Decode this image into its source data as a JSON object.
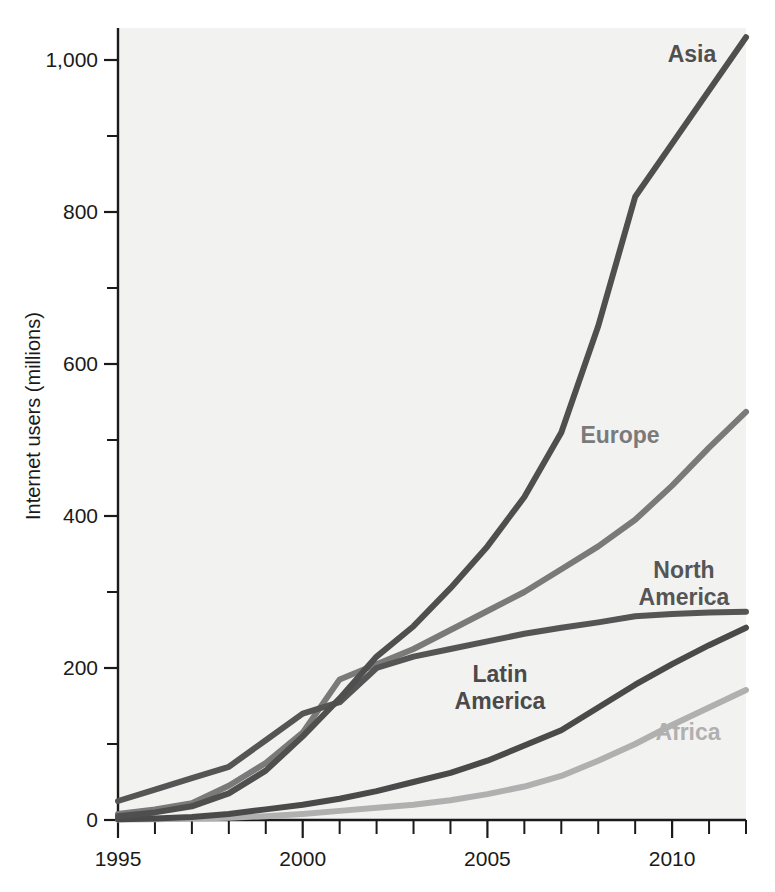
{
  "chart_data": {
    "type": "line",
    "title": "",
    "subtitle": "",
    "xlabel": "",
    "ylabel": "Internet users (millions)",
    "xlim": [
      1995,
      2012
    ],
    "ylim": [
      0,
      1080
    ],
    "grid": false,
    "legend_position": "inline-labels",
    "x_tick_labels": [
      "1995",
      "2000",
      "2005",
      "2010"
    ],
    "x_tick_values": [
      1995,
      2000,
      2005,
      2010
    ],
    "x_minor_ticks": [
      1996,
      1997,
      1998,
      1999,
      2001,
      2002,
      2003,
      2004,
      2006,
      2007,
      2008,
      2009,
      2011,
      2012
    ],
    "y_tick_labels": [
      "0",
      "200",
      "400",
      "600",
      "800",
      "1,000"
    ],
    "y_tick_values": [
      0,
      200,
      400,
      600,
      800,
      1000
    ],
    "y_minor_ticks": [
      100,
      300,
      500,
      700,
      900,
      1100
    ],
    "x": [
      1995,
      1996,
      1997,
      1998,
      1999,
      2000,
      2001,
      2002,
      2003,
      2004,
      2005,
      2006,
      2007,
      2008,
      2009,
      2010,
      2011,
      2012
    ],
    "series": [
      {
        "name": "Asia",
        "color": "#4f4f4f",
        "label": "Asia",
        "values": [
          5,
          10,
          18,
          35,
          65,
          110,
          160,
          215,
          255,
          305,
          360,
          425,
          510,
          650,
          820,
          890,
          960,
          1030
        ]
      },
      {
        "name": "Europe",
        "color": "#7a7a7a",
        "label": "Europe",
        "values": [
          8,
          14,
          22,
          45,
          75,
          115,
          185,
          205,
          225,
          250,
          275,
          300,
          330,
          360,
          395,
          440,
          490,
          537
        ]
      },
      {
        "name": "North America",
        "color": "#555555",
        "label": "North America",
        "values": [
          25,
          40,
          55,
          70,
          105,
          140,
          155,
          200,
          215,
          225,
          235,
          245,
          253,
          260,
          268,
          271,
          273,
          274
        ]
      },
      {
        "name": "Latin America",
        "color": "#4a4a4a",
        "label": "Latin America",
        "values": [
          1,
          2,
          4,
          8,
          14,
          20,
          28,
          38,
          50,
          62,
          78,
          98,
          118,
          148,
          178,
          205,
          230,
          253
        ]
      },
      {
        "name": "Africa",
        "color": "#b0b0b0",
        "label": "Africa",
        "values": [
          0.5,
          1,
          2,
          3,
          5,
          8,
          12,
          16,
          20,
          26,
          34,
          44,
          58,
          78,
          100,
          125,
          148,
          171
        ]
      }
    ],
    "series_label_positions": [
      {
        "name": "Asia",
        "x": 692,
        "y": 62,
        "anchor": "middle",
        "lines": [
          "Asia"
        ]
      },
      {
        "name": "Europe",
        "x": 620,
        "y": 443,
        "anchor": "middle",
        "lines": [
          "Europe"
        ]
      },
      {
        "name": "North America",
        "x": 684,
        "y": 578,
        "anchor": "middle",
        "lines": [
          "North",
          "America"
        ]
      },
      {
        "name": "Latin America",
        "x": 500,
        "y": 682,
        "anchor": "middle",
        "lines": [
          "Latin",
          "America"
        ]
      },
      {
        "name": "Africa",
        "x": 688,
        "y": 740,
        "anchor": "middle",
        "lines": [
          "Africa"
        ]
      }
    ]
  },
  "axis": {
    "y_title": "Internet users (millions)"
  },
  "colors": {
    "plot_background": "#f2f2f1",
    "axis": "#1a1a1a",
    "asia": "#4f4f4f",
    "europe": "#7a7a7a",
    "north_america": "#555555",
    "latin_america": "#4a4a4a",
    "africa": "#b0b0b0"
  }
}
